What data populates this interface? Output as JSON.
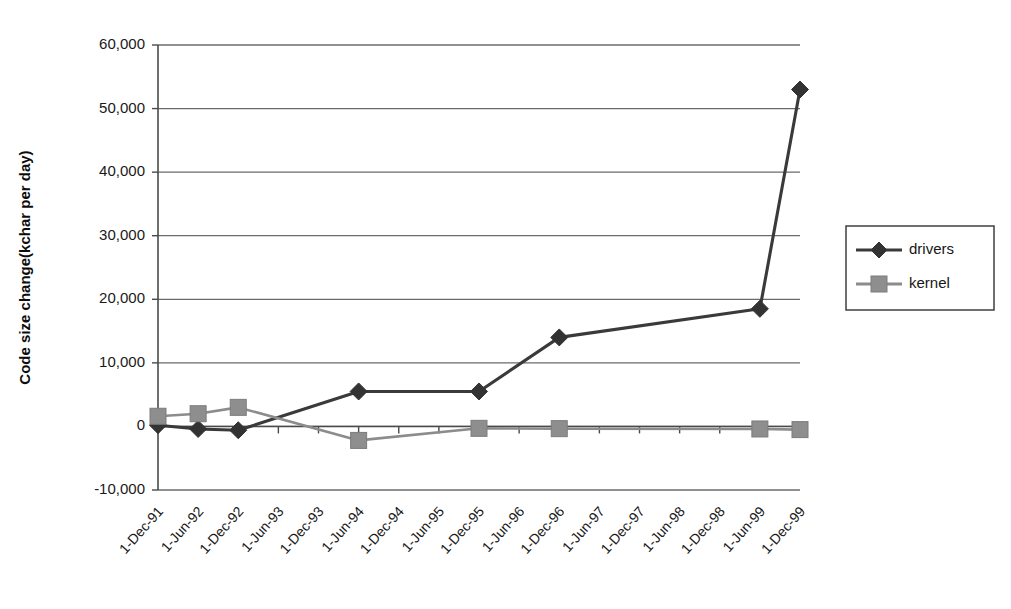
{
  "chart_data": {
    "type": "line",
    "title": "",
    "xlabel": "",
    "ylabel": "Code size change(kchar per day)",
    "ylim": [
      -10000,
      60000
    ],
    "ytick_labels": [
      "60,000",
      "50,000",
      "40,000",
      "30,000",
      "20,000",
      "10,000",
      "0",
      "-10,000"
    ],
    "ytick_values": [
      60000,
      50000,
      40000,
      30000,
      20000,
      10000,
      0,
      -10000
    ],
    "grid": true,
    "grid_axis": "y",
    "legend_position": "right",
    "categories": [
      "1-Dec-91",
      "1-Jun-92",
      "1-Dec-92",
      "1-Jun-93",
      "1-Dec-93",
      "1-Jun-94",
      "1-Dec-94",
      "1-Jun-95",
      "1-Dec-95",
      "1-Jun-96",
      "1-Dec-96",
      "1-Jun-97",
      "1-Dec-97",
      "1-Jun-98",
      "1-Dec-98",
      "1-Jun-99",
      "1-Dec-99"
    ],
    "series": [
      {
        "name": "drivers",
        "color": "#333333",
        "marker": "diamond",
        "values": [
          200,
          -400,
          -600,
          null,
          null,
          5500,
          null,
          null,
          5500,
          null,
          14000,
          null,
          null,
          null,
          null,
          18500,
          53000
        ]
      },
      {
        "name": "kernel",
        "color": "#8e8e8e",
        "marker": "square",
        "values": [
          1600,
          2000,
          3000,
          null,
          null,
          -2200,
          null,
          null,
          -300,
          null,
          -350,
          null,
          null,
          null,
          null,
          -400,
          -500
        ]
      }
    ]
  },
  "legend": {
    "items": [
      {
        "label": "drivers",
        "marker": "diamond-marker"
      },
      {
        "label": "kernel",
        "marker": "square-marker"
      }
    ]
  }
}
